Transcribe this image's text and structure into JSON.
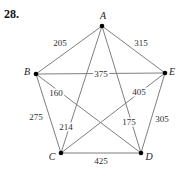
{
  "problem": {
    "number": "28."
  },
  "graph": {
    "type": "weighted-complete-graph-K5",
    "vertices": [
      {
        "id": "A",
        "label": "A"
      },
      {
        "id": "B",
        "label": "B"
      },
      {
        "id": "C",
        "label": "C"
      },
      {
        "id": "D",
        "label": "D"
      },
      {
        "id": "E",
        "label": "E"
      }
    ],
    "edges": [
      {
        "from": "A",
        "to": "B",
        "weight": "205"
      },
      {
        "from": "A",
        "to": "E",
        "weight": "315"
      },
      {
        "from": "B",
        "to": "E",
        "weight": "375"
      },
      {
        "from": "B",
        "to": "D",
        "weight": "160"
      },
      {
        "from": "C",
        "to": "E",
        "weight": "405"
      },
      {
        "from": "B",
        "to": "C",
        "weight": "275"
      },
      {
        "from": "A",
        "to": "C",
        "weight": "214"
      },
      {
        "from": "A",
        "to": "D",
        "weight": "175"
      },
      {
        "from": "D",
        "to": "E",
        "weight": "305"
      },
      {
        "from": "C",
        "to": "D",
        "weight": "425"
      }
    ],
    "colors": {
      "edge_stroke": "#7f7f7f",
      "vertex_fill": "#000000",
      "text": "#2e2e2e"
    }
  }
}
